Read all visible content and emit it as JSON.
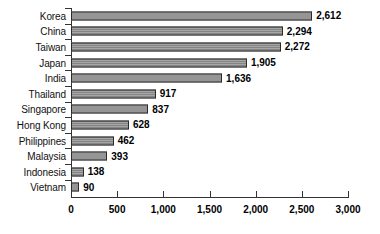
{
  "chart_data": {
    "type": "bar",
    "orientation": "horizontal",
    "title": "",
    "subtitle": "",
    "xlabel": "",
    "ylabel": "",
    "categories": [
      "Korea",
      "China",
      "Taiwan",
      "Japan",
      "India",
      "Thailand",
      "Singapore",
      "Hong Kong",
      "Philippines",
      "Malaysia",
      "Indonesia",
      "Vietnam"
    ],
    "values": [
      2612,
      2294,
      2272,
      1905,
      1636,
      917,
      837,
      628,
      462,
      393,
      138,
      90
    ],
    "value_labels": [
      "2,612",
      "2,294",
      "2,272",
      "1,905",
      "1,636",
      "917",
      "837",
      "628",
      "462",
      "393",
      "138",
      "90"
    ],
    "xlim": [
      0,
      3000
    ],
    "xticks": [
      0,
      500,
      1000,
      1500,
      2000,
      2500,
      3000
    ],
    "xtick_labels": [
      "0",
      "500",
      "1,000",
      "1,500",
      "2,000",
      "2,500",
      "3,000"
    ],
    "grid": false,
    "legend": null,
    "legend_position": "none",
    "bar_color": "#8d8d8d",
    "bar_border_color": "#2b2b2b",
    "axis_color": "#333333",
    "text_color": "#000000"
  }
}
